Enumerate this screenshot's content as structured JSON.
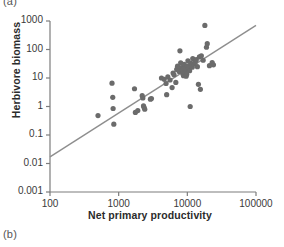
{
  "figure": {
    "panel_a_label": "(a)",
    "panel_b_label": "(b)"
  },
  "chart_data": {
    "type": "scatter",
    "title": "",
    "xlabel": "Net primary productivity",
    "ylabel": "Herbivore biomass",
    "xscale": "log",
    "yscale": "log",
    "xlim": [
      100,
      100000
    ],
    "ylim": [
      0.001,
      1000
    ],
    "xticks": [
      100,
      1000,
      10000,
      100000
    ],
    "xtick_labels": [
      "100",
      "1000",
      "10000",
      "100000"
    ],
    "yticks": [
      0.001,
      0.01,
      0.1,
      1,
      10,
      100,
      1000
    ],
    "ytick_labels": [
      "0.001",
      "0.01",
      "0.1",
      "1",
      "10",
      "100",
      "1000"
    ],
    "grid": false,
    "legend": "none",
    "marker_color": "#6b6b6b",
    "line_color": "#8e8e8e",
    "axis_color": "#7d7d7d",
    "point_radius_px": 2.6,
    "trendline": {
      "type": "linear-loglog",
      "x": [
        100,
        100000
      ],
      "y": [
        0.017,
        700
      ]
    },
    "points": [
      [
        500,
        0.48
      ],
      [
        800,
        6.6
      ],
      [
        820,
        2.1
      ],
      [
        830,
        0.85
      ],
      [
        850,
        0.24
      ],
      [
        1700,
        4.2
      ],
      [
        1750,
        0.62
      ],
      [
        1900,
        0.72
      ],
      [
        2200,
        2.4
      ],
      [
        2250,
        2.0
      ],
      [
        2300,
        1.05
      ],
      [
        2350,
        0.92
      ],
      [
        2400,
        0.8
      ],
      [
        2900,
        1.8
      ],
      [
        3000,
        1.9
      ],
      [
        4200,
        10.0
      ],
      [
        4600,
        9.0
      ],
      [
        4900,
        6.4
      ],
      [
        5000,
        2.6
      ],
      [
        5200,
        11.0
      ],
      [
        5600,
        8.5
      ],
      [
        6000,
        4.6
      ],
      [
        6200,
        15.0
      ],
      [
        6400,
        13.0
      ],
      [
        6800,
        7.0
      ],
      [
        7000,
        20.0
      ],
      [
        7200,
        26.0
      ],
      [
        7600,
        17.0
      ],
      [
        7800,
        90.0
      ],
      [
        8000,
        34.0
      ],
      [
        8200,
        23.0
      ],
      [
        8400,
        19.0
      ],
      [
        8600,
        14.0
      ],
      [
        8800,
        12.0
      ],
      [
        9000,
        30.0
      ],
      [
        9200,
        22.0
      ],
      [
        9400,
        16.0
      ],
      [
        9600,
        11.5
      ],
      [
        9800,
        13.5
      ],
      [
        10000,
        26.0
      ],
      [
        10200,
        40.0
      ],
      [
        10500,
        21.0
      ],
      [
        10800,
        18.0
      ],
      [
        11000,
        1.0
      ],
      [
        11200,
        33.0
      ],
      [
        11500,
        28.0
      ],
      [
        11800,
        24.0
      ],
      [
        12000,
        48.0
      ],
      [
        12500,
        31.0
      ],
      [
        13000,
        36.0
      ],
      [
        13500,
        44.0
      ],
      [
        14000,
        25.0
      ],
      [
        14500,
        6.0
      ],
      [
        15000,
        55.0
      ],
      [
        15500,
        4.0
      ],
      [
        16000,
        60.0
      ],
      [
        17000,
        42.0
      ],
      [
        18000,
        700.0
      ],
      [
        19000,
        120.0
      ],
      [
        19500,
        160.0
      ],
      [
        21000,
        27.0
      ],
      [
        23000,
        35.0
      ],
      [
        24000,
        29.0
      ]
    ]
  }
}
